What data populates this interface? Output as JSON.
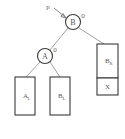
{
  "figure": {
    "background_color": "#ffffff",
    "node_stroke_color": "#3a3a3a",
    "edge_color": "#8a8a8a",
    "text_color": "#555555"
  },
  "pointer": {
    "label": "p",
    "target": "node-b"
  },
  "nodes": [
    {
      "id": "node-b",
      "label": "B",
      "balance": "0",
      "cx": 73,
      "cy": 22,
      "r": 7.5
    },
    {
      "id": "node-a",
      "label": "A",
      "balance": "0",
      "cx": 45,
      "cy": 56,
      "r": 7.5
    }
  ],
  "subtrees": [
    {
      "id": "box-al",
      "label": "A",
      "subscript": "L",
      "x": 15,
      "y": 77,
      "width": 20,
      "height": 38
    },
    {
      "id": "box-bl",
      "label": "B",
      "subscript": "L",
      "x": 50,
      "y": 77,
      "width": 20,
      "height": 38
    },
    {
      "id": "box-br",
      "label": "B",
      "subscript": "R",
      "x": 97,
      "y": 44,
      "width": 21,
      "height": 34
    },
    {
      "id": "box-x",
      "label": "X",
      "subscript": "",
      "x": 97,
      "y": 78,
      "width": 21,
      "height": 17
    }
  ],
  "edges": [
    {
      "from": "node-b",
      "to": "node-a"
    },
    {
      "from": "node-b",
      "to": "box-br"
    },
    {
      "from": "node-a",
      "to": "box-al"
    },
    {
      "from": "node-a",
      "to": "box-bl"
    }
  ]
}
